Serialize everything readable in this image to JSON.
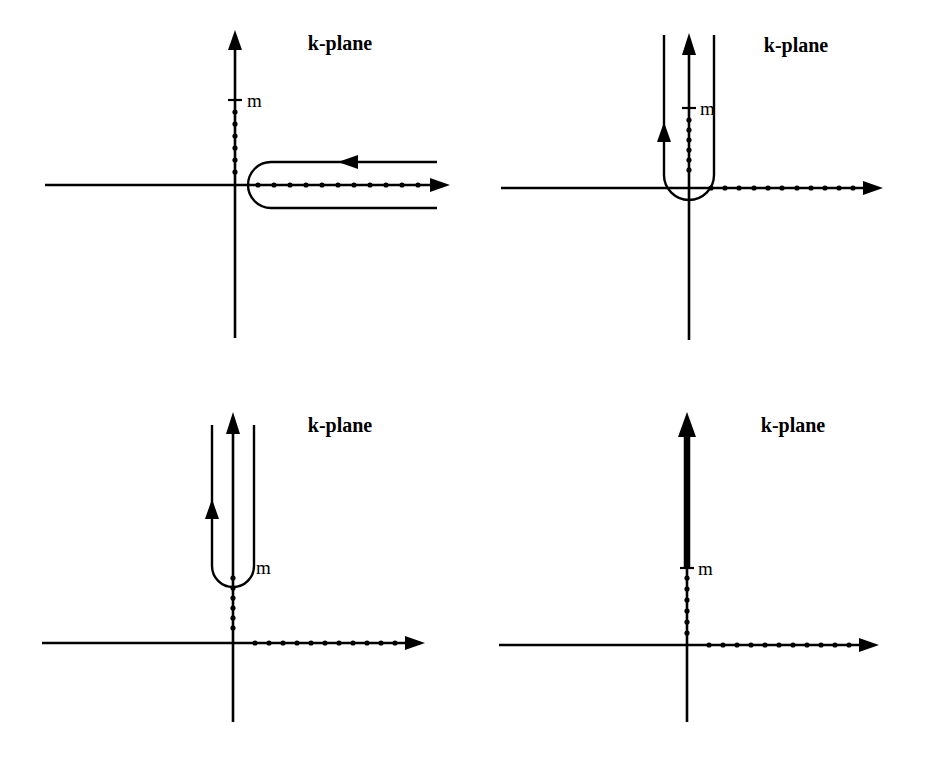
{
  "figure": {
    "panel_count": 4,
    "background_color": "#ffffff",
    "ink_color": "#000000"
  },
  "labels": {
    "plane": "k-plane",
    "mass_point": "m"
  },
  "panels": [
    {
      "id": "panel-1",
      "name": "hairpin-contour-around-positive-real-axis",
      "plane_label": "k-plane",
      "mass_label": "m",
      "origin": {
        "x": 235,
        "y": 185
      },
      "real_axis": {
        "x1": 45,
        "x2": 450,
        "y": 185,
        "arrow": "right"
      },
      "imag_axis": {
        "x": 235,
        "y1": 30,
        "y2": 338,
        "arrow": "up"
      },
      "mass_tick": {
        "x": 235,
        "y": 100,
        "half_width": 7
      },
      "label_offset": {
        "dx": 10,
        "dy": 6
      },
      "imag_cut_dots": {
        "x": 235,
        "y_start": 112,
        "y_end": 172,
        "count": 6
      },
      "real_cut_dots": {
        "y": 185,
        "x_start": 258,
        "x_end": 418,
        "count": 11
      },
      "contour": {
        "type": "hairpin-open-right",
        "nose_x": 248,
        "right_end_x": 437,
        "top_y": 162,
        "bottom_y": 208,
        "arrow_x": 352,
        "arrow_direction": "left"
      },
      "plane_label_pos": {
        "x": 340,
        "y": 50
      }
    },
    {
      "id": "panel-2",
      "name": "u-contour-hugging-imaginary-cut-from-origin",
      "plane_label": "k-plane",
      "mass_label": "m",
      "origin": {
        "x": 218,
        "y": 188
      },
      "real_axis": {
        "x1": 30,
        "x2": 412,
        "y": 188,
        "arrow": "right"
      },
      "imag_axis": {
        "x": 218,
        "y1": 33,
        "y2": 340,
        "arrow": "up"
      },
      "mass_tick": {
        "x": 218,
        "y": 108,
        "half_width": 7
      },
      "label_offset": {
        "dx": 10,
        "dy": 6
      },
      "imag_cut_dots": {
        "x": 218,
        "y_start": 120,
        "y_end": 170,
        "count": 6
      },
      "real_cut_dots": {
        "y": 188,
        "x_start": 240,
        "x_end": 382,
        "count": 11
      },
      "contour": {
        "type": "u-open-top",
        "left_x": 193,
        "right_x": 243,
        "bottom_y": 175,
        "top_y": 35,
        "radius": 25,
        "arrow_y": 128,
        "arrow_direction": "up",
        "arrow_branch": "left"
      },
      "plane_label_pos": {
        "x": 325,
        "y": 52
      }
    },
    {
      "id": "panel-3",
      "name": "u-contour-lifted-to-mass-threshold",
      "plane_label": "k-plane",
      "mass_label": "m",
      "origin": {
        "x": 233,
        "y": 643
      },
      "real_axis": {
        "x1": 42,
        "x2": 425,
        "y": 643,
        "arrow": "right"
      },
      "imag_axis": {
        "x": 233,
        "y1": 412,
        "y2": 722,
        "arrow": "up"
      },
      "mass_tick": {
        "x": 233,
        "y": 568,
        "half_width": 0
      },
      "label_offset": {
        "dx": 13,
        "dy": 7
      },
      "imag_cut_dots": {
        "x": 233,
        "y_start": 578,
        "y_end": 628,
        "count": 6
      },
      "real_cut_dots": {
        "y": 643,
        "x_start": 255,
        "x_end": 395,
        "count": 11
      },
      "contour": {
        "type": "u-open-top",
        "left_x": 212,
        "right_x": 254,
        "bottom_y": 566,
        "top_y": 425,
        "radius": 21,
        "arrow_y": 505,
        "arrow_direction": "up",
        "arrow_branch": "left"
      },
      "plane_label_pos": {
        "x": 340,
        "y": 432
      }
    },
    {
      "id": "panel-4",
      "name": "collapsed-contour-thick-cut-above-threshold",
      "plane_label": "k-plane",
      "mass_label": "m",
      "origin": {
        "x": 216,
        "y": 645
      },
      "real_axis": {
        "x1": 28,
        "x2": 408,
        "y": 645,
        "arrow": "right"
      },
      "imag_axis": {
        "x": 216,
        "y1": 415,
        "y2": 722,
        "arrow": "up"
      },
      "mass_tick": {
        "x": 216,
        "y": 568,
        "half_width": 7
      },
      "label_offset": {
        "dx": 10,
        "dy": 7
      },
      "imag_cut_dots": {
        "x": 216,
        "y_start": 578,
        "y_end": 630,
        "count": 6
      },
      "real_cut_dots": {
        "y": 645,
        "x_start": 238,
        "x_end": 378,
        "count": 11
      },
      "contour": {
        "type": "thick-vertical-cut",
        "x": 216,
        "y_bottom": 568,
        "y_top": 425,
        "arrow_direction": "up"
      },
      "plane_label_pos": {
        "x": 322,
        "y": 432
      }
    }
  ]
}
